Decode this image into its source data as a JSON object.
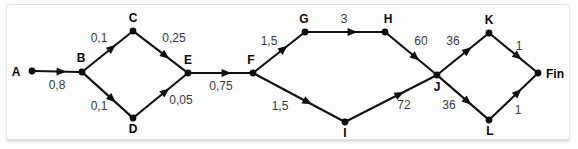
{
  "diagram": {
    "type": "directed-graph",
    "background_color": "#fdfdfd",
    "node_color": "#0d0d0d",
    "edge_color": "#101010",
    "label_color": "#3a3a3a",
    "nodes": [
      {
        "id": "A",
        "label": "A",
        "x": 32,
        "y": 71,
        "label_x": 16,
        "label_y": 76,
        "label_anchor": "middle"
      },
      {
        "id": "B",
        "label": "B",
        "x": 82,
        "y": 72,
        "label_x": 81,
        "label_y": 62,
        "label_anchor": "middle"
      },
      {
        "id": "C",
        "label": "C",
        "x": 133,
        "y": 31,
        "label_x": 133,
        "label_y": 22,
        "label_anchor": "middle"
      },
      {
        "id": "D",
        "label": "D",
        "x": 133,
        "y": 118,
        "label_x": 133,
        "label_y": 133,
        "label_anchor": "middle"
      },
      {
        "id": "E",
        "label": "E",
        "x": 188,
        "y": 73,
        "label_x": 188,
        "label_y": 64,
        "label_anchor": "middle"
      },
      {
        "id": "F",
        "label": "F",
        "x": 253,
        "y": 73,
        "label_x": 251,
        "label_y": 64,
        "label_anchor": "middle"
      },
      {
        "id": "G",
        "label": "G",
        "x": 305,
        "y": 32,
        "label_x": 304,
        "label_y": 23,
        "label_anchor": "middle"
      },
      {
        "id": "H",
        "label": "H",
        "x": 385,
        "y": 32,
        "label_x": 388,
        "label_y": 23,
        "label_anchor": "middle"
      },
      {
        "id": "I",
        "label": "I",
        "x": 345,
        "y": 122,
        "label_x": 345,
        "label_y": 137,
        "label_anchor": "middle"
      },
      {
        "id": "J",
        "label": "J",
        "x": 437,
        "y": 75,
        "label_x": 437,
        "label_y": 91,
        "label_anchor": "middle"
      },
      {
        "id": "K",
        "label": "K",
        "x": 489,
        "y": 33,
        "label_x": 489,
        "label_y": 24,
        "label_anchor": "middle"
      },
      {
        "id": "L",
        "label": "L",
        "x": 489,
        "y": 120,
        "label_x": 490,
        "label_y": 135,
        "label_anchor": "middle"
      },
      {
        "id": "Fin",
        "label": "Fin",
        "x": 538,
        "y": 73,
        "label_x": 546,
        "label_y": 78,
        "label_anchor": "start"
      }
    ],
    "edges": [
      {
        "from": "A",
        "to": "B",
        "weight": "0,8",
        "label_x": 57,
        "label_y": 89
      },
      {
        "from": "B",
        "to": "C",
        "weight": "0,1",
        "label_x": 99,
        "label_y": 42
      },
      {
        "from": "B",
        "to": "D",
        "weight": "0,1",
        "label_x": 99,
        "label_y": 110
      },
      {
        "from": "C",
        "to": "E",
        "weight": "0,25",
        "label_x": 174,
        "label_y": 42
      },
      {
        "from": "D",
        "to": "E",
        "weight": "0,05",
        "label_x": 181,
        "label_y": 104
      },
      {
        "from": "E",
        "to": "F",
        "weight": "0,75",
        "label_x": 221,
        "label_y": 90
      },
      {
        "from": "F",
        "to": "G",
        "weight": "1,5",
        "label_x": 269,
        "label_y": 45
      },
      {
        "from": "F",
        "to": "I",
        "weight": "1,5",
        "label_x": 280,
        "label_y": 110
      },
      {
        "from": "G",
        "to": "H",
        "weight": "3",
        "label_x": 344,
        "label_y": 23
      },
      {
        "from": "H",
        "to": "J",
        "weight": "60",
        "label_x": 421,
        "label_y": 45
      },
      {
        "from": "I",
        "to": "J",
        "weight": "72",
        "label_x": 404,
        "label_y": 109
      },
      {
        "from": "J",
        "to": "K",
        "weight": "36",
        "label_x": 453,
        "label_y": 45
      },
      {
        "from": "J",
        "to": "L",
        "weight": "36",
        "label_x": 449,
        "label_y": 109
      },
      {
        "from": "K",
        "to": "Fin",
        "weight": "1",
        "label_x": 519,
        "label_y": 50
      },
      {
        "from": "L",
        "to": "Fin",
        "weight": "1",
        "label_x": 518,
        "label_y": 114
      }
    ]
  }
}
